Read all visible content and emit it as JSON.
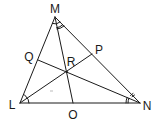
{
  "diagram": {
    "type": "triangle-angle-bisectors",
    "stroke_color": "#1a1a1a",
    "background": "#ffffff",
    "vertices": {
      "M": {
        "label": "M",
        "x": 55,
        "y": 17,
        "label_x": 55,
        "label_y": 9
      },
      "L": {
        "label": "L",
        "x": 20,
        "y": 103,
        "label_x": 12,
        "label_y": 105
      },
      "N": {
        "label": "N",
        "x": 140,
        "y": 103,
        "label_x": 147,
        "label_y": 106
      }
    },
    "points": {
      "R": {
        "label": "R",
        "x": 67,
        "y": 72,
        "label_x": 71,
        "label_y": 62
      },
      "Q": {
        "label": "Q",
        "x": 38,
        "y": 60,
        "label_x": 29,
        "label_y": 57
      },
      "P": {
        "label": "P",
        "x": 92,
        "y": 54,
        "label_x": 99,
        "label_y": 50
      },
      "O": {
        "label": "O",
        "x": 73,
        "y": 103,
        "label_x": 73,
        "label_y": 115
      }
    },
    "segments": [
      {
        "from": "L",
        "to": "M"
      },
      {
        "from": "M",
        "to": "N"
      },
      {
        "from": "L",
        "to": "N"
      },
      {
        "from": "M",
        "to": "O"
      },
      {
        "from": "L",
        "to": "P"
      },
      {
        "from": "N",
        "to": "Q"
      }
    ],
    "angle_marks": [
      {
        "vertex": "L",
        "arcs": 1
      },
      {
        "vertex": "M",
        "arcs": 2
      },
      {
        "vertex": "N",
        "arcs": 2
      }
    ],
    "labels": [
      "M",
      "Q",
      "P",
      "R",
      "L",
      "O",
      "N"
    ]
  }
}
